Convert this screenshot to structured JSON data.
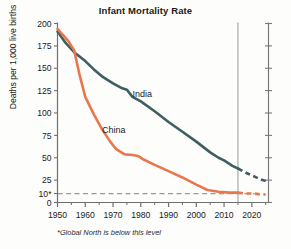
{
  "chart_data": {
    "type": "line",
    "title": "Infant Mortality Rate",
    "xlabel": "",
    "ylabel": "Deaths per 1,000 live births",
    "footnote": "*Global North is below this level",
    "xlim": [
      1950,
      2026
    ],
    "ylim": [
      0,
      200
    ],
    "grid": false,
    "legend": "inline-labels",
    "y_ticks": [
      0,
      10,
      25,
      50,
      75,
      100,
      125,
      150,
      175,
      200
    ],
    "y_tick_labels": [
      "0",
      "10*",
      "25",
      "50",
      "75",
      "100",
      "125",
      "150",
      "175",
      "200"
    ],
    "x_ticks": [
      1950,
      1960,
      1970,
      1980,
      1990,
      2000,
      2010,
      2020
    ],
    "x_tick_labels": [
      "1950",
      "1960",
      "1970",
      "1980",
      "1990",
      "2000",
      "2010",
      "2020"
    ],
    "x_minor_ticks": [
      1955,
      1965,
      1975,
      1985,
      1995,
      2005,
      2015,
      2025
    ],
    "reference_line": {
      "y": 10,
      "style": "dashed",
      "color": "#9a9a9a",
      "note": "Global North level"
    },
    "projection_divider": {
      "x": 2015,
      "color": "#8d8d8d"
    },
    "right_axis": {
      "x": 2026,
      "ticks": [
        0,
        25,
        50,
        75,
        100,
        125,
        150,
        175,
        200
      ]
    },
    "series": [
      {
        "name": "India",
        "color": "#3e5f60",
        "label_x": 1977,
        "label_y": 118,
        "historical": [
          [
            1950,
            191
          ],
          [
            1953,
            178
          ],
          [
            1956,
            168
          ],
          [
            1960,
            158
          ],
          [
            1963,
            149
          ],
          [
            1966,
            141
          ],
          [
            1970,
            133
          ],
          [
            1973,
            128
          ],
          [
            1975,
            126
          ],
          [
            1977,
            118
          ],
          [
            1980,
            113
          ],
          [
            1985,
            102
          ],
          [
            1990,
            90
          ],
          [
            1995,
            79
          ],
          [
            2000,
            68
          ],
          [
            2005,
            56
          ],
          [
            2008,
            50
          ],
          [
            2010,
            47
          ],
          [
            2013,
            41
          ],
          [
            2015,
            38
          ]
        ],
        "projected": [
          [
            2015,
            38
          ],
          [
            2018,
            33
          ],
          [
            2021,
            29
          ],
          [
            2023,
            26
          ],
          [
            2025,
            24
          ]
        ]
      },
      {
        "name": "China",
        "color": "#e8774e",
        "label_x": 1966,
        "label_y": 78,
        "historical": [
          [
            1950,
            194
          ],
          [
            1954,
            180
          ],
          [
            1956,
            170
          ],
          [
            1958,
            142
          ],
          [
            1960,
            118
          ],
          [
            1963,
            99
          ],
          [
            1966,
            82
          ],
          [
            1969,
            68
          ],
          [
            1971,
            60
          ],
          [
            1974,
            54
          ],
          [
            1977,
            53
          ],
          [
            1979,
            52
          ],
          [
            1981,
            48
          ],
          [
            1985,
            42
          ],
          [
            1990,
            35
          ],
          [
            1995,
            28
          ],
          [
            2000,
            20
          ],
          [
            2004,
            14
          ],
          [
            2008,
            12
          ],
          [
            2012,
            11
          ],
          [
            2015,
            11
          ]
        ],
        "projected": [
          [
            2015,
            11
          ],
          [
            2018,
            10
          ],
          [
            2021,
            10
          ],
          [
            2023,
            9
          ],
          [
            2025,
            9
          ]
        ]
      }
    ]
  }
}
